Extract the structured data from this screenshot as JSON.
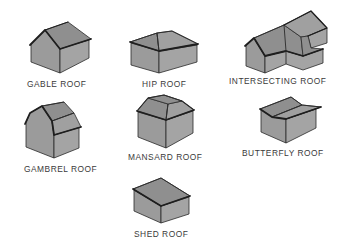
{
  "diagram": {
    "type": "roof-styles-illustration",
    "items": [
      {
        "id": "gable",
        "label": "GABLE ROOF"
      },
      {
        "id": "hip",
        "label": "HIP ROOF"
      },
      {
        "id": "intersecting",
        "label": "INTERSECTING ROOF"
      },
      {
        "id": "gambrel",
        "label": "GAMBREL ROOF"
      },
      {
        "id": "mansard",
        "label": "MANSARD ROOF"
      },
      {
        "id": "butterfly",
        "label": "BUTTERFLY ROOF"
      },
      {
        "id": "shed",
        "label": "SHED ROOF"
      }
    ],
    "colors": {
      "background": "#ffffff",
      "wall": "#9b9b9b",
      "roof": "#8f8f8f",
      "outline": "#2a2a2a",
      "label": "#3a3a3a"
    }
  }
}
